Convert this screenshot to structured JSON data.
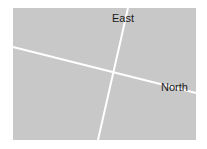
{
  "diagram": {
    "background_color": "#c8c8c8",
    "line_color": "#ffffff",
    "labels": {
      "east": "East",
      "north": "North"
    }
  }
}
